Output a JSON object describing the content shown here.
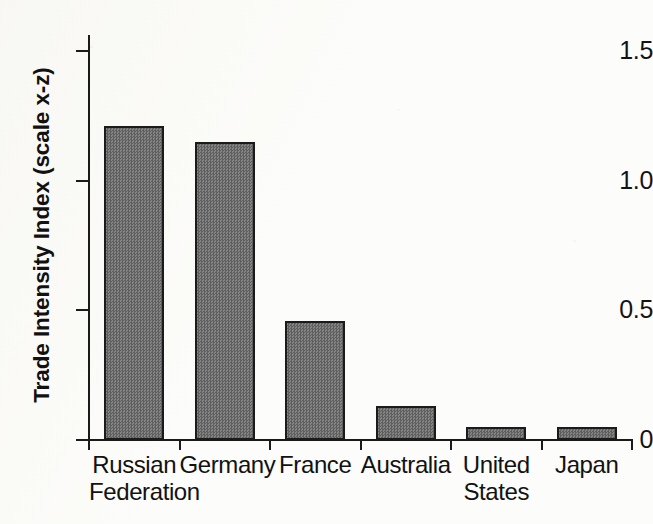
{
  "chart_data": {
    "type": "bar",
    "title": "",
    "subtitle": "",
    "xlabel": "",
    "ylabel": "Trade Intensity Index (scale x-z)",
    "ylim": [
      0,
      1.5
    ],
    "yticks": [
      "0",
      "0.5",
      "1.0",
      "1.5"
    ],
    "ytick_values": [
      0,
      0.5,
      1.0,
      1.5
    ],
    "grid": false,
    "legend": null,
    "categories": [
      "Russian Federation",
      "Germany",
      "France",
      "Australia",
      "United States",
      "Japan"
    ],
    "category_lines": [
      [
        "Russian",
        "Federation"
      ],
      [
        "Germany"
      ],
      [
        "France"
      ],
      [
        "Australia"
      ],
      [
        "United",
        "States"
      ],
      [
        "Japan"
      ]
    ],
    "values": [
      1.21,
      1.15,
      0.46,
      0.13,
      0.05,
      0.05
    ],
    "bar_fill_color": "#6e6e6e",
    "bar_border_color": "#1b1b1b",
    "axis_color": "#1a1a1a",
    "background_color": "#fcfcfa"
  }
}
